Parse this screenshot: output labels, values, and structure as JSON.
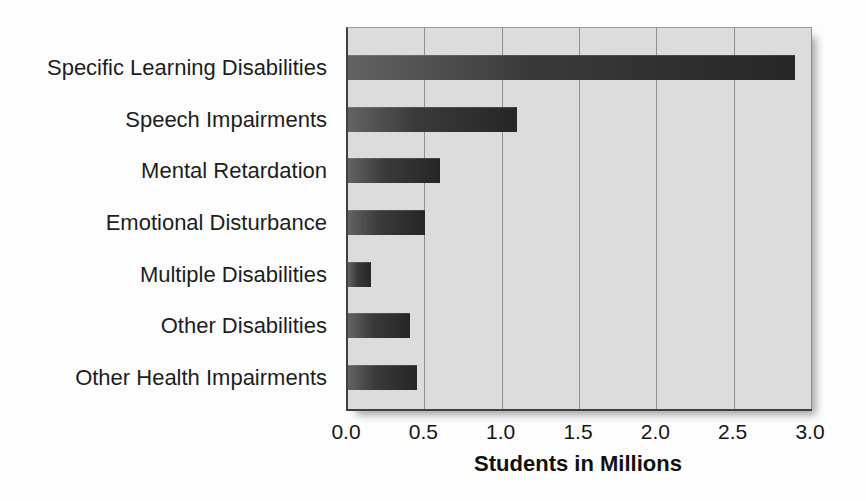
{
  "chart_data": {
    "type": "bar",
    "orientation": "horizontal",
    "title": "",
    "categories": [
      "Specific Learning Disabilities",
      "Speech Impairments",
      "Mental Retardation",
      "Emotional Disturbance",
      "Multiple Disabilities",
      "Other Disabilities",
      "Other Health Impairments"
    ],
    "values": [
      2.9,
      1.1,
      0.6,
      0.5,
      0.15,
      0.4,
      0.45
    ],
    "xlabel": "Students in Millions",
    "ylabel": "",
    "xlim": [
      0.0,
      3.0
    ],
    "xtick_labels": [
      "0.0",
      "0.5",
      "1.0",
      "1.5",
      "2.0",
      "2.5",
      "3.0"
    ],
    "xtick_values": [
      0.0,
      0.5,
      1.0,
      1.5,
      2.0,
      2.5,
      3.0
    ],
    "grid": "vertical",
    "legend": "none",
    "colors": {
      "bar_dark": "#262626",
      "bar_light": "#636363",
      "plot_background": "#dcdcdc",
      "gridline": "#8f8f8f",
      "axis": "#3f3f3f",
      "page_background": "#fdfdfd",
      "text": "#111111"
    }
  }
}
